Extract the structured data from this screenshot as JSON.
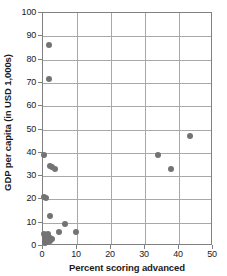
{
  "chart_data": {
    "type": "scatter",
    "title": "",
    "xlabel": "Percent scoring advanced",
    "ylabel": "GDP per capita (in USD 1,000s)",
    "xlim": [
      0,
      50
    ],
    "ylim": [
      0,
      100
    ],
    "xticks": [
      0,
      10,
      20,
      30,
      40,
      50
    ],
    "yticks": [
      0,
      10,
      20,
      30,
      40,
      50,
      60,
      70,
      80,
      90,
      100
    ],
    "xtick_labels": [
      "0",
      "10",
      "20",
      "30",
      "40",
      "50"
    ],
    "ytick_labels": [
      "0",
      "10",
      "20",
      "30",
      "40",
      "50",
      "60",
      "70",
      "80",
      "90",
      "100"
    ],
    "grid": "both",
    "legend": "none",
    "marker_color": "#737373",
    "marker_shape": "circle",
    "points": [
      {
        "x": 1.9,
        "y": 86.3
      },
      {
        "x": 1.7,
        "y": 71.6
      },
      {
        "x": 43.2,
        "y": 47.1
      },
      {
        "x": 0.3,
        "y": 39.0
      },
      {
        "x": 33.8,
        "y": 39.0
      },
      {
        "x": 37.7,
        "y": 33.1
      },
      {
        "x": 2.1,
        "y": 34.2
      },
      {
        "x": 2.7,
        "y": 34.0
      },
      {
        "x": 3.6,
        "y": 33.1
      },
      {
        "x": 0.3,
        "y": 21.0
      },
      {
        "x": 0.9,
        "y": 20.5
      },
      {
        "x": 2.0,
        "y": 12.9
      },
      {
        "x": 6.6,
        "y": 9.4
      },
      {
        "x": 4.6,
        "y": 6.2
      },
      {
        "x": 9.8,
        "y": 5.8
      },
      {
        "x": 0.4,
        "y": 5.0
      },
      {
        "x": 0.7,
        "y": 4.3
      },
      {
        "x": 1.1,
        "y": 4.8
      },
      {
        "x": 1.3,
        "y": 3.6
      },
      {
        "x": 1.5,
        "y": 5.1
      },
      {
        "x": 1.8,
        "y": 3.3
      },
      {
        "x": 2.2,
        "y": 3.4
      },
      {
        "x": 2.6,
        "y": 3.2
      },
      {
        "x": 0.5,
        "y": 2.6
      },
      {
        "x": 0.9,
        "y": 2.2
      },
      {
        "x": 1.2,
        "y": 1.9
      },
      {
        "x": 0.6,
        "y": 1.2
      },
      {
        "x": 1.0,
        "y": 3.0
      },
      {
        "x": 1.6,
        "y": 2.4
      },
      {
        "x": 2.0,
        "y": 2.0
      }
    ]
  }
}
